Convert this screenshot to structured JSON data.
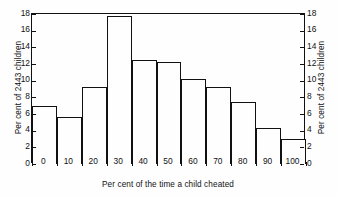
{
  "chart_data": {
    "type": "bar",
    "title": "",
    "subtitle": "",
    "xlabel": "Per cent of the time a child cheated",
    "ylabel": "Per cent of 2443 children",
    "ylabel_right": "Per cent of 2443 children",
    "categories": [
      "0",
      "10",
      "20",
      "30",
      "40",
      "50",
      "60",
      "70",
      "80",
      "90",
      "100"
    ],
    "values": [
      7.0,
      5.6,
      9.3,
      17.8,
      12.5,
      12.3,
      10.2,
      9.3,
      7.4,
      4.3,
      3.0
    ],
    "xlim": [
      -5,
      105
    ],
    "ylim": [
      0,
      18
    ],
    "y_ticks": [
      "0",
      "2",
      "4",
      "6",
      "8",
      "10",
      "12",
      "14",
      "16",
      "18"
    ],
    "y_tick_values": [
      0,
      2,
      4,
      6,
      8,
      10,
      12,
      14,
      16,
      18
    ],
    "x_ticks": [
      "0",
      "10",
      "20",
      "30",
      "40",
      "50",
      "60",
      "70",
      "80",
      "90",
      "100"
    ],
    "x_tick_values": [
      0,
      10,
      20,
      30,
      40,
      50,
      60,
      70,
      80,
      90,
      100
    ],
    "bar_width": 10,
    "bars_centered_on_ticks": true,
    "grid": false,
    "legend": false,
    "dual_y_axis": true,
    "bar_fill_color": "#fefefe",
    "bar_edge_color": "#111111",
    "axis_color": "#111111",
    "background_color": "#ffffff"
  }
}
